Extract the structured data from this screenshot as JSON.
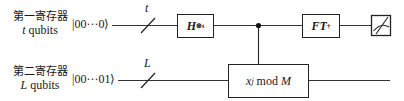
{
  "diagram": {
    "type": "quantum-circuit",
    "registers": [
      {
        "title": "第一寄存器",
        "size_var": "t",
        "size_label": "qubits",
        "initial_state": "|00···0⟩",
        "wire_label": "t"
      },
      {
        "title": "第二寄存器",
        "size_var": "L",
        "size_label": "qubits",
        "initial_state": "|00···01⟩",
        "wire_label": "L"
      }
    ],
    "gates": {
      "hadamard": {
        "base": "H",
        "sup": "⊗t"
      },
      "modexp": {
        "base": "x",
        "sup": "j",
        "rest": " mod ",
        "mod": "M"
      },
      "inverse_ft": {
        "base": "FT",
        "sup": "†"
      },
      "measure": {
        "icon": "meter-icon"
      }
    },
    "colors": {
      "line": "#222222",
      "background": "#ffffff"
    }
  }
}
